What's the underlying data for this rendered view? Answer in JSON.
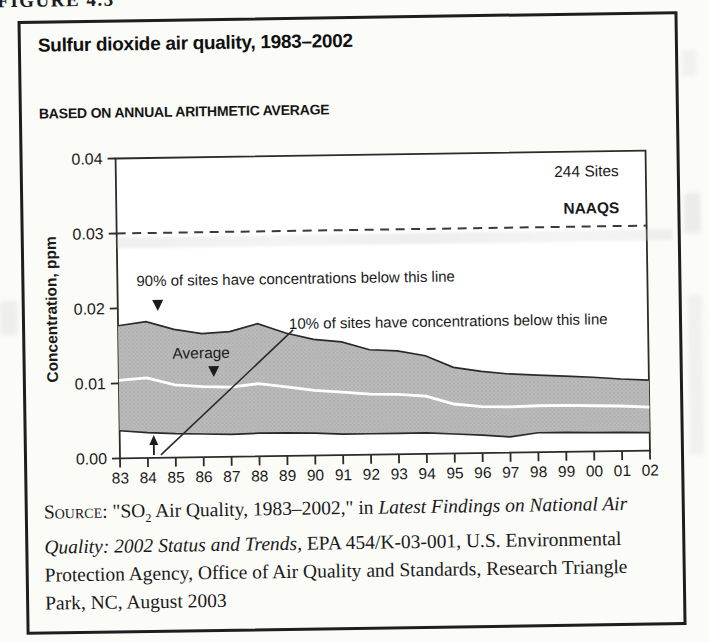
{
  "figure_label": "FIGURE 4.3",
  "title": "Sulfur dioxide air quality, 1983–2002",
  "subtitle": "BASED ON ANNUAL ARITHMETIC AVERAGE",
  "chart_labels": {
    "sites_count": "244 Sites",
    "naaqs": "NAAQS",
    "p90_annotation": "90% of sites have concentrations below this line",
    "p10_annotation": "10% of sites have concentrations below this line",
    "average_label": "Average"
  },
  "chart_data": {
    "type": "area",
    "title": "Sulfur dioxide air quality, 1983–2002",
    "subtitle": "BASED ON ANNUAL ARITHMETIC AVERAGE",
    "ylabel": "Concentration, ppm",
    "xlabel": "",
    "ylim": [
      0,
      0.04
    ],
    "yticks": [
      0.0,
      0.01,
      0.02,
      0.03,
      0.04
    ],
    "ytick_labels": [
      "0.00",
      "0.01",
      "0.02",
      "0.03",
      "0.04"
    ],
    "x": [
      "83",
      "84",
      "85",
      "86",
      "87",
      "88",
      "89",
      "90",
      "91",
      "92",
      "93",
      "94",
      "95",
      "96",
      "97",
      "98",
      "99",
      "00",
      "01",
      "02"
    ],
    "series": [
      {
        "name": "90th percentile",
        "values": [
          0.0177,
          0.0182,
          0.0171,
          0.0165,
          0.0167,
          0.0177,
          0.0164,
          0.0155,
          0.0151,
          0.014,
          0.0138,
          0.0131,
          0.0115,
          0.0109,
          0.0105,
          0.0103,
          0.0101,
          0.0099,
          0.0096,
          0.0094
        ]
      },
      {
        "name": "Average",
        "values": [
          0.0104,
          0.0107,
          0.0097,
          0.0094,
          0.0093,
          0.0097,
          0.0092,
          0.0087,
          0.0084,
          0.0081,
          0.008,
          0.0077,
          0.0066,
          0.0062,
          0.0061,
          0.0062,
          0.0062,
          0.0061,
          0.006,
          0.0058
        ]
      },
      {
        "name": "10th percentile",
        "values": [
          0.0037,
          0.0034,
          0.0032,
          0.0031,
          0.003,
          0.0031,
          0.0031,
          0.003,
          0.0028,
          0.0028,
          0.0028,
          0.0028,
          0.0026,
          0.0024,
          0.0021,
          0.0026,
          0.0026,
          0.0025,
          0.0025,
          0.0024
        ]
      }
    ],
    "reference_line": {
      "label": "NAAQS",
      "value": 0.03
    },
    "annotation_site_count": "244 Sites",
    "legend_position": "none",
    "grid": false
  },
  "source": {
    "label": "Source:",
    "part1": " \"SO",
    "sub": "2",
    "part2": " Air Quality, 1983–2002,\" in ",
    "italic": "Latest Findings on National Air Quality: 2002 Status and Trends,",
    "part3": " EPA 454/K-03-001, U.S. Environmental Protection Agency, Office of Air Quality and Standards, Research Triangle Park, NC, August 2003"
  },
  "colors": {
    "band_fill": "#bcbcbc",
    "band_dot": "#999999",
    "curve_stroke": "#2a2a2a",
    "average_line": "#ffffff",
    "axis": "#2b2b2b",
    "dashed_reference": "#3a3a3a"
  }
}
